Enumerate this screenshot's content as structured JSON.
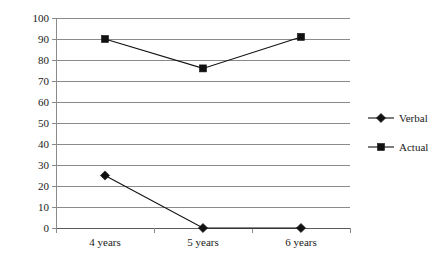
{
  "chart_data": {
    "type": "line",
    "title": "",
    "subtitle": "",
    "xlabel": "",
    "ylabel": "",
    "categories": [
      "4 years",
      "5 years",
      "6 years"
    ],
    "series": [
      {
        "name": "Verbal",
        "marker": "diamond",
        "color": "#111111",
        "values": [
          25,
          0,
          0
        ]
      },
      {
        "name": "Actual",
        "marker": "square",
        "color": "#111111",
        "values": [
          90,
          76,
          91
        ]
      }
    ],
    "ylim": [
      0,
      100
    ],
    "y_ticks": [
      0,
      10,
      20,
      30,
      40,
      50,
      60,
      70,
      80,
      90,
      100
    ],
    "y_tick_labels": [
      "0",
      "10",
      "20",
      "30",
      "40",
      "50",
      "60",
      "70",
      "80",
      "90",
      "100"
    ],
    "grid": true,
    "grid_axis": "y",
    "grid_color": "#8a8a8a",
    "legend_position": "right"
  },
  "legend": {
    "items": [
      {
        "label": "Verbal",
        "marker": "diamond-marker-icon"
      },
      {
        "label": "Actual",
        "marker": "square-marker-icon"
      }
    ]
  }
}
